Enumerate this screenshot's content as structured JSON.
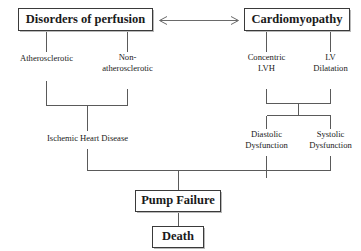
{
  "diagram": {
    "title_text": "Pathophysiology flowchart of heart failure",
    "background_color": "#ffffff",
    "line_color": "#5a5a5a",
    "box_border_color": "#3a3a3a",
    "text_color": "#1a1a1a",
    "nodes": {
      "disorders_of_perfusion": {
        "label": "Disorders of  perfusion",
        "style": "boxed-bold"
      },
      "cardiomyopathy": {
        "label": "Cardiomyopathy",
        "style": "boxed-bold"
      },
      "atherosclerotic": {
        "label": "Atherosclerotic",
        "style": "plain"
      },
      "non_atherosclerotic_line1": {
        "label": "Non-",
        "style": "plain"
      },
      "non_atherosclerotic_line2": {
        "label": "atherosclerotic",
        "style": "plain"
      },
      "concentric_lvh_line1": {
        "label": "Concentric",
        "style": "plain"
      },
      "concentric_lvh_line2": {
        "label": "LVH",
        "style": "plain"
      },
      "lv_dilatation_line1": {
        "label": "LV",
        "style": "plain"
      },
      "lv_dilatation_line2": {
        "label": "Dilatation",
        "style": "plain"
      },
      "ischemic_heart_disease": {
        "label": "Ischemic Heart Disease",
        "style": "plain"
      },
      "diastolic_dysfunction_line1": {
        "label": "Diastolic",
        "style": "plain"
      },
      "diastolic_dysfunction_line2": {
        "label": "Dysfunction",
        "style": "plain"
      },
      "systolic_dysfunction_line1": {
        "label": "Systolic",
        "style": "plain"
      },
      "systolic_dysfunction_line2": {
        "label": "Dysfunction",
        "style": "plain"
      },
      "pump_failure": {
        "label": "Pump Failure",
        "style": "boxed-bold"
      },
      "death": {
        "label": "Death",
        "style": "boxed-bold"
      }
    },
    "connector_icon": "double-headed-arrow"
  }
}
